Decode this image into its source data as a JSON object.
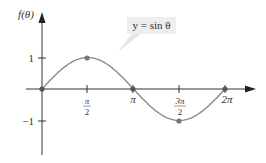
{
  "chart_data": {
    "type": "line",
    "title": "",
    "xlabel": "θ",
    "ylabel": "f(θ)",
    "legend_label": "y = sin θ",
    "x_ticks": [
      "π/2",
      "π",
      "3π/2",
      "2π"
    ],
    "y_ticks": [
      "1",
      "−1"
    ],
    "xlim": [
      0,
      6.2832
    ],
    "ylim": [
      -1,
      1
    ],
    "grid": false,
    "series": [
      {
        "name": "y = sin θ",
        "x": [
          0,
          1.5708,
          3.1416,
          4.7124,
          6.2832
        ],
        "x_labels": [
          "0",
          "π/2",
          "π",
          "3π/2",
          "2π"
        ],
        "values": [
          0,
          1,
          0,
          -1,
          0
        ]
      }
    ],
    "marked_points": [
      {
        "x": "0",
        "y": 0
      },
      {
        "x": "π/2",
        "y": 1
      },
      {
        "x": "π",
        "y": 0
      },
      {
        "x": "3π/2",
        "y": -1
      },
      {
        "x": "2π",
        "y": 0
      }
    ]
  },
  "labels": {
    "y_axis_title": "f(θ)",
    "legend": "y = sin θ",
    "y_tick_pos": "1",
    "y_tick_neg": "−1",
    "x_tick_pi_half_num": "π",
    "x_tick_pi_half_den": "2",
    "x_tick_pi": "π",
    "x_tick_3pi_half_num": "3π",
    "x_tick_3pi_half_den": "2",
    "x_tick_2pi": "2π"
  },
  "colors": {
    "curve": "#8a8a8a",
    "axis": "#333333",
    "point": "#777777",
    "legend_bg": "#eeeeee"
  }
}
